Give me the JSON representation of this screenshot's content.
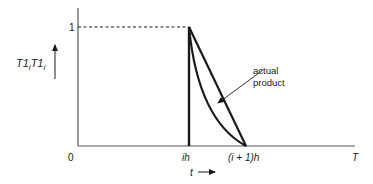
{
  "diagram": {
    "y_axis": {
      "label_main": "T1",
      "label_sub": "i",
      "label_main2": "T1",
      "label_sub2": "i",
      "tick_one": "1"
    },
    "x_axis": {
      "origin": "0",
      "tick_ih": "ih",
      "tick_next": "(i + 1)h",
      "end": "T",
      "variable": "t",
      "variable_arrow": "→"
    },
    "annotation": {
      "line1": "actual",
      "line2": "product"
    },
    "colors": {
      "line": "#1a1a1a",
      "axis": "#555555",
      "background": "#ffffff"
    }
  }
}
